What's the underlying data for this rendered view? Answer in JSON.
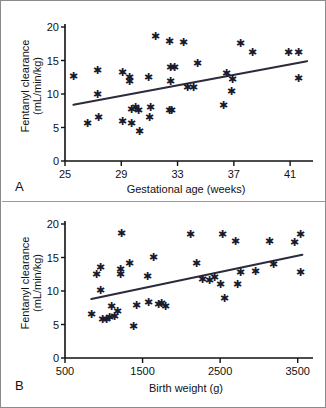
{
  "figure": {
    "background": "#ffffff",
    "border_color": "#8a8a8a",
    "marker_color": "#1a1a2e",
    "line_color": "#2b2b3d",
    "axis_color": "#111111"
  },
  "panels": {
    "a": {
      "letter": "A",
      "xlabel": "Gestational age (weeks)",
      "ylabel_line1": "Fentanyl clearance",
      "ylabel_line2": "(mL/min/kg)"
    },
    "b": {
      "letter": "B",
      "xlabel": "Birth weight (g)",
      "ylabel_line1": "Fentanyl clearance",
      "ylabel_line2": "(mL/min/kg)"
    }
  },
  "chart_data": [
    {
      "id": "panel-a",
      "type": "scatter",
      "title": "",
      "xlabel": "Gestational age (weeks)",
      "ylabel": "Fentanyl clearance (mL/min/kg)",
      "xlim": [
        25,
        42.2
      ],
      "ylim": [
        0,
        20
      ],
      "xticks": [
        25,
        29,
        33,
        37,
        41
      ],
      "xtick_labels": [
        "25",
        "29",
        "33",
        "37",
        "41"
      ],
      "yticks": [
        0,
        5,
        10,
        15,
        20
      ],
      "ytick_labels": [
        "0",
        "5",
        "10",
        "15",
        "20"
      ],
      "grid": false,
      "legend": "none",
      "marker": "asterisk",
      "points": [
        [
          25.6,
          12.5
        ],
        [
          26.6,
          5.5
        ],
        [
          27.3,
          13.4
        ],
        [
          27.3,
          9.8
        ],
        [
          27.4,
          6.4
        ],
        [
          29.1,
          13.1
        ],
        [
          29.1,
          5.8
        ],
        [
          29.6,
          12.3
        ],
        [
          29.6,
          11.8
        ],
        [
          29.7,
          7.6
        ],
        [
          29.7,
          5.4
        ],
        [
          30.0,
          7.9
        ],
        [
          30.2,
          7.4
        ],
        [
          30.3,
          4.2
        ],
        [
          30.9,
          12.4
        ],
        [
          31.0,
          6.4
        ],
        [
          31.1,
          7.8
        ],
        [
          31.4,
          18.4
        ],
        [
          32.4,
          7.4
        ],
        [
          32.6,
          7.4
        ],
        [
          32.4,
          17.7
        ],
        [
          32.5,
          13.8
        ],
        [
          32.8,
          13.8
        ],
        [
          32.5,
          11.7
        ],
        [
          33.4,
          17.5
        ],
        [
          33.7,
          10.8
        ],
        [
          34.1,
          10.9
        ],
        [
          34.4,
          14.4
        ],
        [
          36.3,
          8.2
        ],
        [
          36.5,
          13.0
        ],
        [
          36.9,
          12.1
        ],
        [
          36.8,
          10.3
        ],
        [
          37.5,
          17.4
        ],
        [
          38.3,
          16.1
        ],
        [
          40.9,
          16.1
        ],
        [
          41.6,
          16.1
        ],
        [
          41.6,
          12.2
        ]
      ],
      "regression_line": {
        "x1": 25.6,
        "y1": 8.4,
        "x2": 42.2,
        "y2": 14.9
      }
    },
    {
      "id": "panel-b",
      "type": "scatter",
      "title": "",
      "xlabel": "Birth weight (g)",
      "ylabel": "Fentanyl clearance (mL/min/kg)",
      "xlim": [
        500,
        3620
      ],
      "ylim": [
        0,
        20
      ],
      "xticks": [
        500,
        1500,
        2500,
        3500
      ],
      "xtick_labels": [
        "500",
        "1500",
        "2500",
        "3500"
      ],
      "yticks": [
        0,
        5,
        10,
        15,
        20
      ],
      "ytick_labels": [
        "0",
        "5",
        "10",
        "15",
        "20"
      ],
      "grid": false,
      "legend": "none",
      "marker": "asterisk",
      "points": [
        [
          840,
          6.4
        ],
        [
          900,
          12.3
        ],
        [
          960,
          13.4
        ],
        [
          960,
          10.0
        ],
        [
          980,
          5.6
        ],
        [
          1040,
          5.6
        ],
        [
          1080,
          5.9
        ],
        [
          1100,
          7.6
        ],
        [
          1140,
          6.0
        ],
        [
          1180,
          6.8
        ],
        [
          1210,
          12.4
        ],
        [
          1220,
          13.1
        ],
        [
          1230,
          18.4
        ],
        [
          1330,
          13.9
        ],
        [
          1380,
          4.6
        ],
        [
          1420,
          7.7
        ],
        [
          1560,
          12.1
        ],
        [
          1580,
          8.1
        ],
        [
          1640,
          14.8
        ],
        [
          1700,
          7.8
        ],
        [
          1740,
          8.0
        ],
        [
          1790,
          7.5
        ],
        [
          2120,
          18.3
        ],
        [
          2190,
          14.0
        ],
        [
          2270,
          11.6
        ],
        [
          2360,
          11.4
        ],
        [
          2430,
          11.9
        ],
        [
          2530,
          18.3
        ],
        [
          2510,
          10.8
        ],
        [
          2560,
          8.7
        ],
        [
          2700,
          17.2
        ],
        [
          2720,
          10.9
        ],
        [
          2760,
          12.7
        ],
        [
          2960,
          12.8
        ],
        [
          3140,
          17.2
        ],
        [
          3190,
          13.8
        ],
        [
          3460,
          17.1
        ],
        [
          3540,
          18.3
        ],
        [
          3540,
          12.7
        ]
      ],
      "regression_line": {
        "x1": 840,
        "y1": 8.8,
        "x2": 3560,
        "y2": 15.4
      }
    }
  ]
}
